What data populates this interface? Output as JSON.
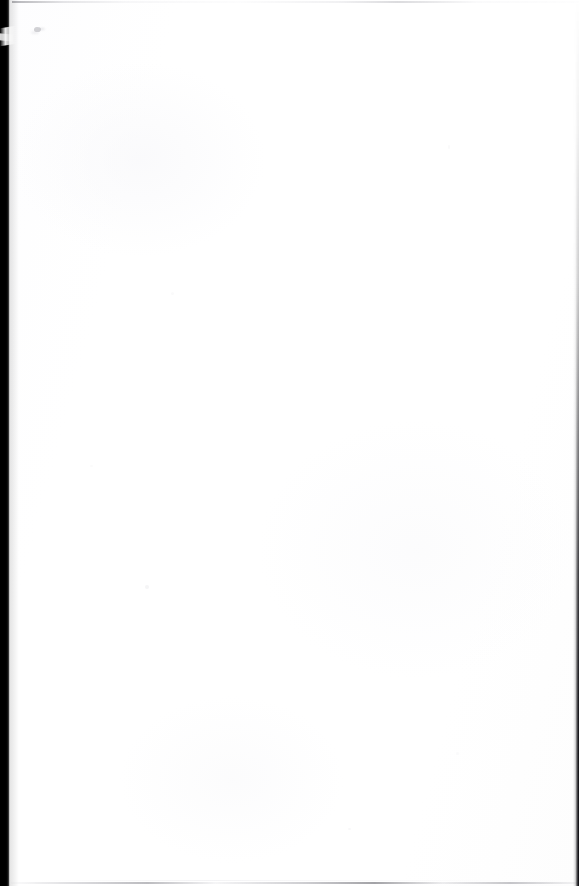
{
  "document": {
    "kind": "scanned-page",
    "page_content_text": "",
    "is_blank": true,
    "width_px": 579,
    "height_px": 886
  },
  "colors": {
    "paper": "#ffffff",
    "paper_tint": "#fdfdfe",
    "gutter_shadow": "#000000",
    "edge_line": "#15151a",
    "scan_line": "#9a9aa2",
    "smudge": "#96969e"
  },
  "artifacts": {
    "gutter_shadow_left": {
      "name": "left-gutter-shadow",
      "description": "solid black scanner gutter band along the left edge",
      "width_px": 10
    },
    "gutter_falloff_left": {
      "name": "left-gutter-falloff",
      "description": "soft gray falloff beside the black band"
    },
    "edge_notch": {
      "name": "page-corner-notch",
      "description": "light wedge artifact interrupting the left black band near the top"
    },
    "gutter_shadow_right": {
      "name": "right-edge-line",
      "description": "thin dark vertical scan line fading in toward the bottom of the right edge",
      "width_px": 6
    },
    "scan_line_top": {
      "name": "top-scan-line",
      "description": "faint broken gray line across the top edge"
    },
    "scan_line_bottom": {
      "name": "bottom-scan-line",
      "description": "faint broken gray line across the bottom edge"
    },
    "ink_smudge": {
      "name": "ink-smudge",
      "description": "small faint gray smudge near the upper-left of the page",
      "x_px": 36,
      "y_px": 30
    },
    "speckles": {
      "name": "paper-speckles",
      "description": "scattered near-invisible noise specks on the blank field",
      "count": 6
    }
  }
}
